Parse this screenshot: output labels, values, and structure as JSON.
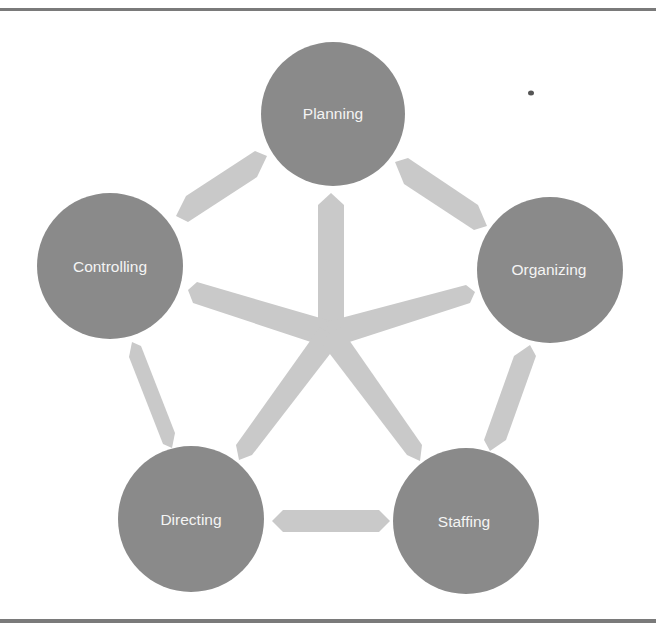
{
  "diagram": {
    "type": "cycle-with-hub",
    "colors": {
      "node_fill": "#8a8a8a",
      "arrow_fill": "#c9c9c9",
      "label_color": "#f4f4f4",
      "frame_line": "#7a7a7a"
    },
    "nodes": [
      {
        "id": "planning",
        "label": "Planning",
        "cx": 333,
        "cy": 114,
        "r": 72
      },
      {
        "id": "organizing",
        "label": "Organizing",
        "cx": 550,
        "cy": 270,
        "r": 73
      },
      {
        "id": "staffing",
        "label": "Staffing",
        "cx": 466,
        "cy": 521,
        "r": 73
      },
      {
        "id": "directing",
        "label": "Directing",
        "cx": 191,
        "cy": 519,
        "r": 73
      },
      {
        "id": "controlling",
        "label": "Controlling",
        "cx": 110,
        "cy": 266,
        "r": 73
      }
    ],
    "cycle_arrows": [
      {
        "from": "planning",
        "to": "organizing",
        "style": "double-headed"
      },
      {
        "from": "organizing",
        "to": "staffing",
        "style": "double-headed"
      },
      {
        "from": "staffing",
        "to": "directing",
        "style": "double-headed"
      },
      {
        "from": "directing",
        "to": "controlling",
        "style": "double-headed"
      },
      {
        "from": "controlling",
        "to": "planning",
        "style": "double-headed"
      }
    ],
    "hub": {
      "center": [
        330,
        335
      ],
      "spokes_to": [
        "planning",
        "organizing",
        "staffing",
        "directing",
        "controlling"
      ]
    }
  }
}
